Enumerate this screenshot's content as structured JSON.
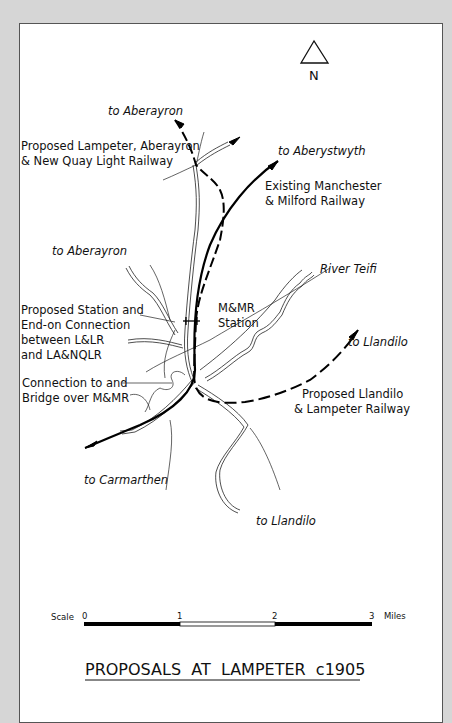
{
  "map": {
    "title": "PROPOSALS  AT  LAMPETER  c1905",
    "north_label": "N",
    "labels": {
      "to_aberayron_top": "to  Aberayron",
      "la_nqlr_line1": "Proposed  Lampeter,  Aberayron",
      "la_nqlr_line2": "& New  Quay  Light  Railway",
      "to_aberystwyth": "to  Aberystwyth",
      "mmr_line1": "Existing   Manchester",
      "mmr_line2": "&  Milford    Railway",
      "to_aberayron_left": "to  Aberayron",
      "river_teifi": "River  Teifi",
      "station_conn_line1": "Proposed  Station  and",
      "station_conn_line2": "End-on  Connection",
      "station_conn_line3": "between  L&LR",
      "station_conn_line4": "and  LA&NQLR",
      "mmr_station_line1": "M&MR",
      "mmr_station_line2": "Station",
      "to_llandilo_right": "to  Llandilo",
      "bridge_line1": "Connection  to  and",
      "bridge_line2": "Bridge  over  M&MR",
      "llr_line1": "Proposed   Llandilo",
      "llr_line2": "&  Lampeter    Railway",
      "to_carmarthen": "to  Carmarthen",
      "to_llandilo_bottom": "to  Llandilo"
    },
    "scale": {
      "label": "Scale",
      "ticks": [
        "0",
        "1",
        "2",
        "3"
      ],
      "unit": "Miles"
    },
    "colors": {
      "background": "#d6d6d6",
      "paper": "#ffffff",
      "ink": "#111111"
    }
  }
}
